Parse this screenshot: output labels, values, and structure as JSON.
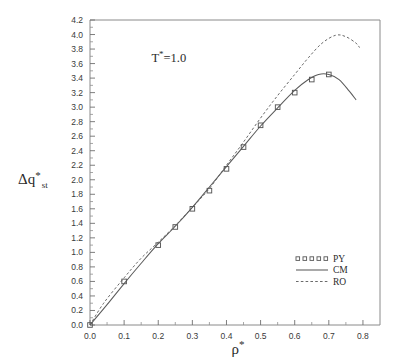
{
  "chart_data": {
    "type": "scatter",
    "title": "",
    "subtitle": "",
    "xlabel": "ρ*",
    "ylabel": "Δq*st",
    "ylabel_parts": {
      "base": "Δq",
      "superscript": "*",
      "subscript": "st"
    },
    "xlabel_parts": {
      "base": "ρ",
      "superscript": "*"
    },
    "xlim": [
      0.0,
      0.85
    ],
    "ylim": [
      0.0,
      4.2
    ],
    "xticks": [
      0.0,
      0.1,
      0.2,
      0.3,
      0.4,
      0.5,
      0.6,
      0.7,
      0.8
    ],
    "xtick_labels": [
      "0.0",
      "0.1",
      "0.2",
      "0.3",
      "0.4",
      "0.5",
      "0.6",
      "0.7",
      "0.8"
    ],
    "yticks": [
      0.0,
      0.2,
      0.4,
      0.6,
      0.8,
      1.0,
      1.2,
      1.4,
      1.6,
      1.8,
      2.0,
      2.2,
      2.4,
      2.6,
      2.8,
      3.0,
      3.2,
      3.4,
      3.6,
      3.8,
      4.0,
      4.2
    ],
    "ytick_labels": [
      "0.0",
      "0.2",
      "0.4",
      "0.6",
      "0.8",
      "1.0",
      "1.2",
      "1.4",
      "1.6",
      "1.8",
      "2.0",
      "2.2",
      "2.4",
      "2.6",
      "2.8",
      "3.0",
      "3.2",
      "3.4",
      "3.6",
      "3.8",
      "4.0",
      "4.2"
    ],
    "grid": false,
    "legend_position": "lower-right",
    "annotations": [
      {
        "text": "T*=1.0",
        "base": "T",
        "superscript": "*",
        "tail": "=1.0",
        "x": 0.18,
        "y": 3.62
      }
    ],
    "series": [
      {
        "name": "PY",
        "type": "scatter",
        "marker": "open-square",
        "x": [
          0.0,
          0.1,
          0.2,
          0.25,
          0.3,
          0.35,
          0.4,
          0.45,
          0.5,
          0.55,
          0.6,
          0.65,
          0.7
        ],
        "y": [
          0.0,
          0.6,
          1.1,
          1.35,
          1.6,
          1.85,
          2.15,
          2.45,
          2.75,
          3.0,
          3.2,
          3.38,
          3.45
        ]
      },
      {
        "name": "CM",
        "type": "line",
        "style": "solid",
        "x": [
          0.0,
          0.05,
          0.1,
          0.15,
          0.2,
          0.25,
          0.3,
          0.35,
          0.4,
          0.45,
          0.5,
          0.55,
          0.6,
          0.64,
          0.67,
          0.7,
          0.73,
          0.76,
          0.78
        ],
        "y": [
          0.0,
          0.28,
          0.57,
          0.85,
          1.12,
          1.36,
          1.62,
          1.9,
          2.18,
          2.46,
          2.74,
          2.99,
          3.23,
          3.38,
          3.45,
          3.45,
          3.38,
          3.22,
          3.1
        ]
      },
      {
        "name": "RO",
        "type": "line",
        "style": "dashed",
        "x": [
          0.0,
          0.04,
          0.1,
          0.15,
          0.2,
          0.25,
          0.3,
          0.35,
          0.4,
          0.45,
          0.5,
          0.55,
          0.6,
          0.64,
          0.68,
          0.72,
          0.75,
          0.78,
          0.79
        ],
        "y": [
          0.0,
          0.3,
          0.65,
          0.92,
          1.14,
          1.37,
          1.62,
          1.88,
          2.2,
          2.52,
          2.85,
          3.16,
          3.45,
          3.68,
          3.88,
          3.99,
          3.97,
          3.88,
          3.82
        ]
      }
    ],
    "legend": [
      {
        "label": "PY",
        "marker": "open-square-row"
      },
      {
        "label": "CM",
        "marker": "solid-line"
      },
      {
        "label": "RO",
        "marker": "dashed-line"
      }
    ]
  },
  "colors": {
    "background": "#ffffff",
    "axis": "#8a8a8a",
    "tick": "#6f6f6f",
    "cm_line": "#5b5b5b",
    "ro_line": "#6a6a6a",
    "marker": "#575757",
    "text": "#2b2b2b"
  }
}
